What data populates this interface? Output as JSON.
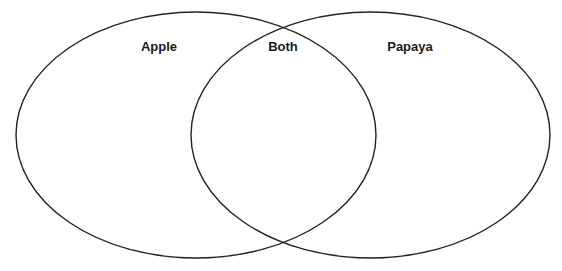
{
  "diagram": {
    "type": "venn",
    "sets": [
      {
        "id": "left",
        "label": "Apple",
        "cx": 196,
        "cy": 135,
        "rx": 180,
        "ry": 123
      },
      {
        "id": "right",
        "label": "Papaya",
        "cx": 370.5,
        "cy": 135,
        "rx": 179.5,
        "ry": 123
      }
    ],
    "intersection": {
      "label": "Both"
    },
    "labels": {
      "left": {
        "text": "Apple",
        "x": 159,
        "y": 51
      },
      "center": {
        "text": "Both",
        "x": 283,
        "y": 51
      },
      "right": {
        "text": "Papaya",
        "x": 410,
        "y": 51
      }
    },
    "stroke_color": "#232323",
    "background_color": "#ffffff"
  }
}
